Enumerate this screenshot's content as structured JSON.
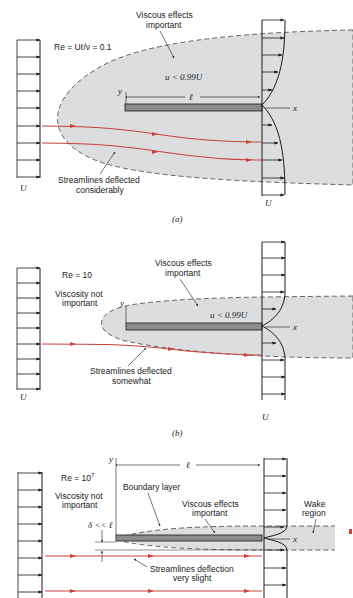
{
  "colors": {
    "shade": "#dcdddf",
    "plate": "#8c8c8c",
    "streamline": "#c8423a",
    "ink": "#1a1a1a",
    "dash": "#444444"
  },
  "panels": [
    {
      "id": "a",
      "caption": "(a)",
      "reynolds": "Re = Uℓ/ν = 0.1",
      "viscous_label_line1": "Viscous effects",
      "viscous_label_line2": "important",
      "velocity_label": "u < 0.99U",
      "length_label": "ℓ",
      "x_axis": "x",
      "y_axis": "y",
      "upstream_U": "U",
      "downstream_U": "U",
      "streamline_label_line1": "Streamlines deflected",
      "streamline_label_line2": "considerably"
    },
    {
      "id": "b",
      "caption": "(b)",
      "reynolds": "Re =  10",
      "viscosity_note_line1": "Viscosity not",
      "viscosity_note_line2": "important",
      "viscous_label_line1": "Viscous effects",
      "viscous_label_line2": "important",
      "velocity_label": "u < 0.99U",
      "x_axis": "x",
      "y_axis": "y",
      "upstream_U": "U",
      "downstream_U": "U",
      "streamline_label_line1": "Streamlines deflected",
      "streamline_label_line2": "somewhat"
    },
    {
      "id": "c",
      "reynolds_base": "Re =  10",
      "reynolds_exp": "7",
      "viscosity_note_line1": "Viscosity not",
      "viscosity_note_line2": "important",
      "boundary_layer_label": "Boundary layer",
      "viscous_label_line1": "Viscous effects",
      "viscous_label_line2": "important",
      "wake_label_line1": "Wake",
      "wake_label_line2": "region",
      "delta_label": "δ << ℓ",
      "length_label": "ℓ",
      "x_axis": "x",
      "y_axis": "y",
      "streamline_label_line1": "Streamlines deflection",
      "streamline_label_line2": "very slight"
    }
  ]
}
